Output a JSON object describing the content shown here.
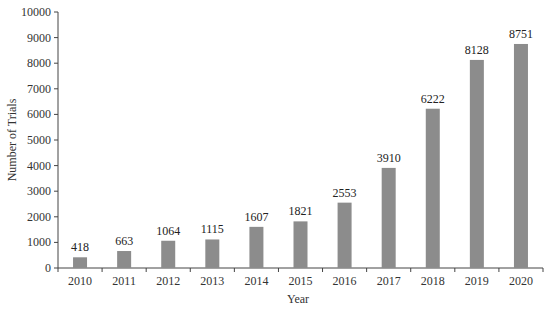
{
  "chart_data": {
    "type": "bar",
    "title": "",
    "xlabel": "Year",
    "ylabel": "Number of Trials",
    "categories": [
      "2010",
      "2011",
      "2012",
      "2013",
      "2014",
      "2015",
      "2016",
      "2017",
      "2018",
      "2019",
      "2020"
    ],
    "values": [
      418,
      663,
      1064,
      1115,
      1607,
      1821,
      2553,
      3910,
      6222,
      8128,
      8751
    ],
    "ylim": [
      0,
      10000
    ],
    "yticks": [
      0,
      1000,
      2000,
      3000,
      4000,
      5000,
      6000,
      7000,
      8000,
      9000,
      10000
    ],
    "grid": false,
    "legend": null,
    "bar_color": "#8c8c8c",
    "data_labels": true
  }
}
